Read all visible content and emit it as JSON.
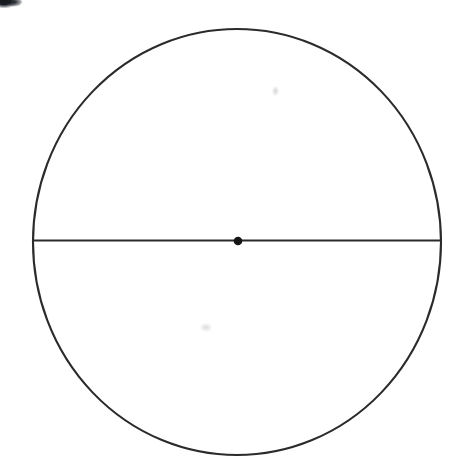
{
  "figure": {
    "background_color": "#ffffff",
    "width": 463,
    "height": 473,
    "stroke_color": "#2b2b2b",
    "dot_color": "#151515",
    "smudge_color": "#1a1c23"
  },
  "chart_data": {
    "type": "scatter",
    "xlabel": "",
    "ylabel": "",
    "grid": false,
    "legend": null,
    "xlim": [
      0,
      463
    ],
    "ylim": [
      0,
      473
    ],
    "annotations": [],
    "shapes": [
      {
        "name": "circle-outline",
        "kind": "ellipse",
        "cx": 237,
        "cy": 242,
        "rx": 204,
        "ry": 213,
        "stroke": "#2b2b2b",
        "stroke_width": 2.1,
        "fill": "none"
      },
      {
        "name": "diameter-line",
        "kind": "line",
        "x1": 34,
        "y1": 240.5,
        "x2": 441,
        "y2": 240.5,
        "stroke": "#2b2b2b",
        "stroke_width": 2.0
      },
      {
        "name": "center-point",
        "kind": "dot",
        "cx": 238,
        "cy": 241,
        "r": 4.3,
        "fill": "#151515"
      }
    ],
    "points": [
      {
        "label": "center",
        "x": 238,
        "y": 241
      }
    ],
    "series": [
      {
        "name": "center-point",
        "values": [
          {
            "x": 238,
            "y": 241
          }
        ]
      }
    ]
  },
  "artifacts": {
    "corner_smudge": {
      "name": "scan-smudge",
      "x": 0,
      "y": 0,
      "width": 26,
      "height": 13
    },
    "specks": [
      {
        "name": "faint-speck-upper-right",
        "x": 272,
        "y": 86
      },
      {
        "name": "faint-speck-lower-left",
        "x": 200,
        "y": 323
      }
    ]
  }
}
